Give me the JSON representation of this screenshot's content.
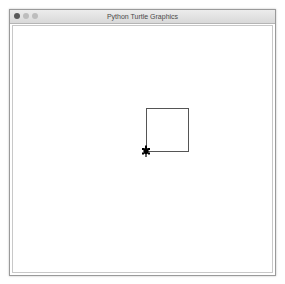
{
  "window": {
    "title": "Python Turtle Graphics",
    "controls": [
      "close",
      "minimize",
      "maximize"
    ]
  },
  "canvas": {
    "shape": "square",
    "square": {
      "x": 146,
      "y": 108,
      "width": 42,
      "height": 43,
      "stroke": "#555555"
    },
    "turtle": {
      "x": 146,
      "y": 151,
      "heading": "up",
      "color": "#000000",
      "icon": "turtle-icon"
    }
  }
}
